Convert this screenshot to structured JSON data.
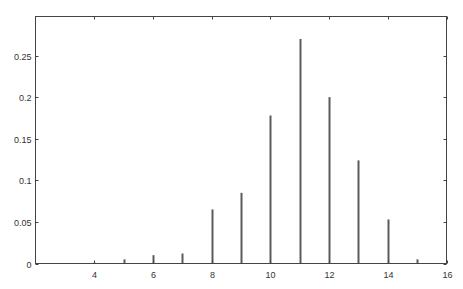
{
  "chart_data": {
    "type": "bar",
    "title": "",
    "xlabel": "",
    "ylabel": "",
    "x": [
      4,
      5,
      6,
      7,
      8,
      9,
      10,
      11,
      12,
      13,
      14,
      15
    ],
    "values": [
      0.001,
      0.005,
      0.01,
      0.012,
      0.065,
      0.085,
      0.178,
      0.27,
      0.2,
      0.124,
      0.053,
      0.005
    ],
    "xlim": [
      2,
      16
    ],
    "ylim": [
      0,
      0.297
    ],
    "xticks": [
      4,
      6,
      8,
      10,
      12,
      14,
      16
    ],
    "xtick_labels": [
      "4",
      "6",
      "8",
      "10",
      "12",
      "14",
      "16"
    ],
    "yticks": [
      0,
      0.05,
      0.1,
      0.15,
      0.2,
      0.25
    ],
    "ytick_labels": [
      "0",
      "0.05",
      "0.1",
      "0.15",
      "0.2",
      "0.25"
    ],
    "grid": false,
    "legend": null,
    "bar_color": "#5a5a5a",
    "axis_color": "#444444"
  }
}
